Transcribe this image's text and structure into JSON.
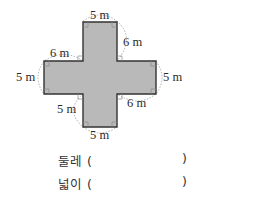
{
  "figure": {
    "shape": "cross",
    "fill_color": "#b9b9b9",
    "stroke_color": "#333333",
    "labels": {
      "top": "5 m",
      "top_right_arm": "6 m",
      "top_left_arm": "6 m",
      "left": "5 m",
      "right": "5 m",
      "bottom_left_arm": "5 m",
      "bottom_right_arm": "6 m",
      "bottom": "5 m"
    }
  },
  "questions": [
    {
      "label": "둘레",
      "open": "(",
      "close": ")"
    },
    {
      "label": "넓이",
      "open": "(",
      "close": ")"
    }
  ]
}
